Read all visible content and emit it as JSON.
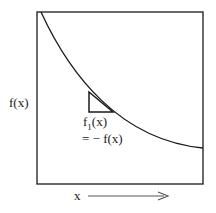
{
  "diagram": {
    "y_label": "f(x)",
    "x_label": "x",
    "annotation_line1_base": "f",
    "annotation_line1_sub": "1",
    "annotation_line1_arg": "(x)",
    "annotation_line2": "= − f(x)"
  },
  "colors": {
    "stroke": "#1a1a1a",
    "arrow": "#555555"
  }
}
